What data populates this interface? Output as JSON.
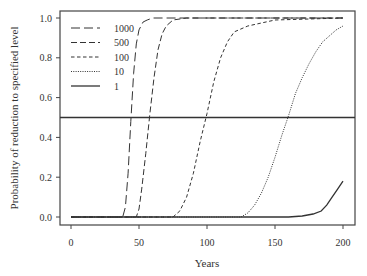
{
  "chart_data": {
    "type": "line",
    "title": "",
    "xlabel": "Years",
    "ylabel": "Probability of reduction to specified level",
    "xlim": [
      0,
      200
    ],
    "ylim": [
      0.0,
      1.0
    ],
    "xticks": [
      0,
      50,
      100,
      150,
      200
    ],
    "yticks": [
      0.0,
      0.2,
      0.4,
      0.6,
      0.8,
      1.0
    ],
    "xtick_labels": [
      "0",
      "50",
      "100",
      "150",
      "200"
    ],
    "ytick_labels": [
      "0.0",
      "0.2",
      "0.4",
      "0.6",
      "0.8",
      "1.0"
    ],
    "grid": false,
    "legend_position": "upper left",
    "reference_line": {
      "y": 0.5,
      "style": "solid"
    },
    "series": [
      {
        "name": "1000",
        "style": "long-dash",
        "x": [
          0,
          38,
          40,
          42,
          44,
          46,
          48,
          50,
          53,
          56,
          60,
          70,
          200
        ],
        "y": [
          0,
          0,
          0.05,
          0.22,
          0.48,
          0.72,
          0.87,
          0.94,
          0.98,
          0.99,
          1.0,
          1.0,
          1.0
        ]
      },
      {
        "name": "500",
        "style": "medium-dash",
        "x": [
          0,
          48,
          50,
          52,
          55,
          58,
          61,
          64,
          67,
          70,
          75,
          85,
          200
        ],
        "y": [
          0,
          0,
          0.04,
          0.14,
          0.32,
          0.52,
          0.7,
          0.84,
          0.92,
          0.96,
          0.99,
          1.0,
          1.0
        ]
      },
      {
        "name": "100",
        "style": "short-dash",
        "x": [
          0,
          75,
          80,
          85,
          90,
          95,
          100,
          105,
          110,
          115,
          120,
          130,
          150,
          200
        ],
        "y": [
          0,
          0,
          0.03,
          0.1,
          0.22,
          0.38,
          0.52,
          0.68,
          0.8,
          0.88,
          0.93,
          0.96,
          0.99,
          1.0
        ]
      },
      {
        "name": "10",
        "style": "dotted",
        "x": [
          0,
          125,
          130,
          135,
          140,
          145,
          150,
          155,
          160,
          165,
          170,
          175,
          180,
          185,
          190,
          195,
          200
        ],
        "y": [
          0,
          0,
          0.02,
          0.06,
          0.12,
          0.2,
          0.3,
          0.41,
          0.51,
          0.62,
          0.7,
          0.77,
          0.83,
          0.88,
          0.91,
          0.94,
          0.96
        ]
      },
      {
        "name": "1",
        "style": "solid",
        "x": [
          0,
          160,
          170,
          178,
          184,
          188,
          192,
          196,
          200
        ],
        "y": [
          0,
          0,
          0.005,
          0.015,
          0.03,
          0.06,
          0.1,
          0.14,
          0.18
        ]
      }
    ]
  }
}
